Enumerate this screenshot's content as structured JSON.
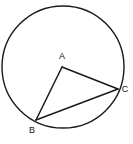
{
  "figure": {
    "kind": "circle-geometry-diagram",
    "width": 133,
    "height": 144,
    "background_color": "#ffffff",
    "stroke_color": "#1a1a1a",
    "label_color": "#111111"
  },
  "circle": {
    "name": "outer-circle",
    "center_x": 63,
    "center_y": 67,
    "radius": 61,
    "stroke_width": 1.4,
    "fill": "#ffffff"
  },
  "points": {
    "a": {
      "label": "A",
      "x": 62,
      "y": 67,
      "label_x": 62,
      "label_y": 59,
      "on_circle": false
    },
    "b": {
      "label": "B",
      "x": 36,
      "y": 120,
      "label_x": 32,
      "label_y": 133,
      "on_circle": true
    },
    "c": {
      "label": "C",
      "x": 118,
      "y": 89,
      "label_x": 125,
      "label_y": 92,
      "on_circle": true
    }
  },
  "segments": [
    {
      "name": "segment-ac",
      "from": "a",
      "to": "c",
      "stroke_width": 1.5
    },
    {
      "name": "segment-ab",
      "from": "a",
      "to": "b",
      "stroke_width": 1.5
    },
    {
      "name": "segment-bc",
      "from": "b",
      "to": "c",
      "stroke_width": 1.5
    }
  ]
}
